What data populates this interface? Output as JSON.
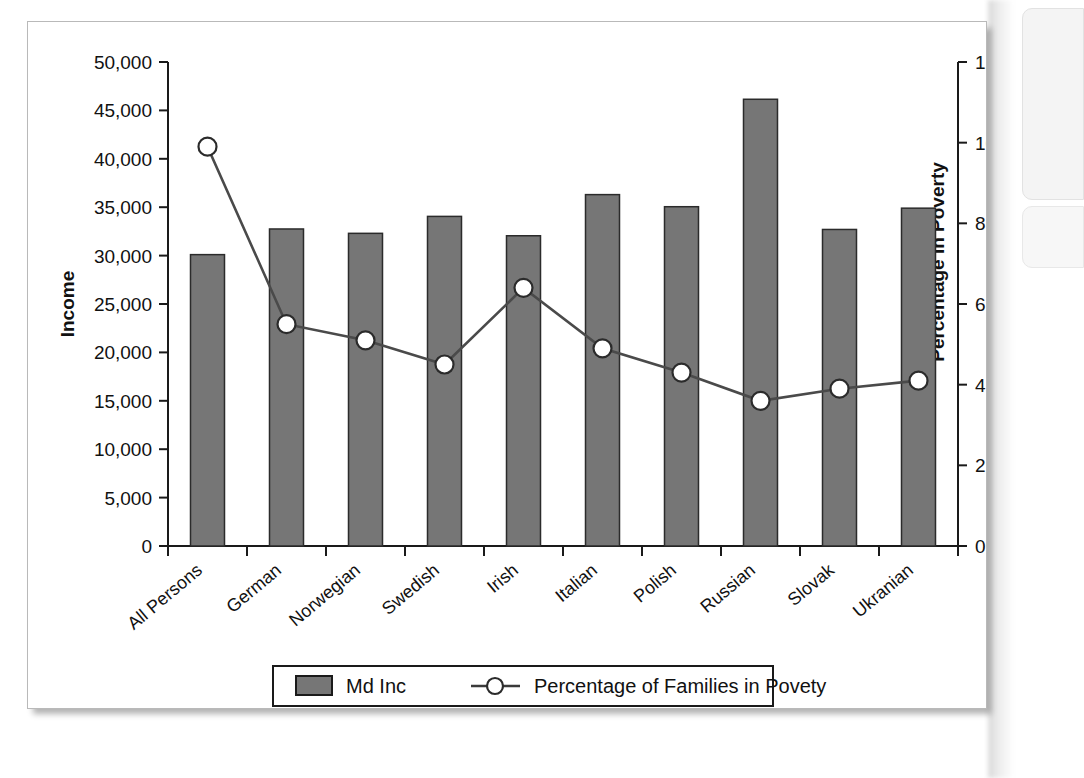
{
  "figure": {
    "panel_background": "#ffffff",
    "panel_border": "#b9b9b9"
  },
  "chart_data": {
    "type": "bar",
    "title": "",
    "subtitle": "",
    "xlabel": "",
    "ylabel": "Income",
    "y2label": "Percentage in Poverty",
    "grid": false,
    "legend_position": "bottom",
    "ylim": [
      0,
      50000
    ],
    "y2lim": [
      0,
      12
    ],
    "ytick_labels": [
      "50,000",
      "45,000",
      "40,000",
      "35,000",
      "30,000",
      "25,000",
      "20,000",
      "15,000",
      "10,000",
      "5,000",
      "0"
    ],
    "ytick_values": [
      50000,
      45000,
      40000,
      35000,
      30000,
      25000,
      20000,
      15000,
      10000,
      5000,
      0
    ],
    "y2tick_labels": [
      "12",
      "10",
      "8",
      "6",
      "4",
      "2",
      "0"
    ],
    "y2tick_values": [
      12,
      10,
      8,
      6,
      4,
      2,
      0
    ],
    "categories": [
      "All Persons",
      "German",
      "Norwegian",
      "Swedish",
      "Irish",
      "Italian",
      "Polish",
      "Russian",
      "Slovak",
      "Ukranian"
    ],
    "series": [
      {
        "name": "Md Inc",
        "type": "bar",
        "axis": "left",
        "color": "#767676",
        "values": [
          30100,
          32750,
          32300,
          34050,
          32050,
          36300,
          35050,
          46150,
          32700,
          34900
        ]
      },
      {
        "name": "Percentage of Families in Povety",
        "type": "line",
        "axis": "right",
        "color": "#4a4a4a",
        "marker": "circle-open",
        "values": [
          9.9,
          5.5,
          5.1,
          4.5,
          6.4,
          4.9,
          4.3,
          3.6,
          3.9,
          4.1
        ]
      }
    ]
  },
  "legend": {
    "items": [
      {
        "label": "Md Inc",
        "kind": "bar-swatch"
      },
      {
        "label": "Percentage of Families in Povety",
        "kind": "line-marker"
      }
    ]
  }
}
